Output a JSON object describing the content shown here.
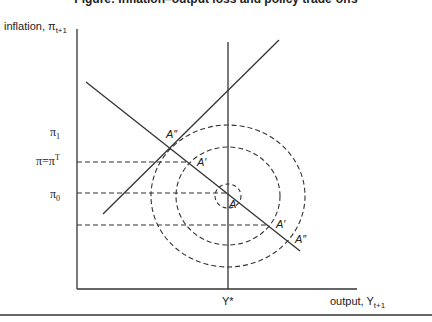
{
  "title": "Figure: Inflation–output loss and policy trade-offs",
  "axes": {
    "y_label": "inflation, π",
    "y_label_sub": "t+1",
    "x_label": "output, Y",
    "x_label_sub": "t+1"
  },
  "y_ticks": [
    {
      "label": "π",
      "sub": "1",
      "sup": ""
    },
    {
      "label": "π=π",
      "sub": "",
      "sup": "T"
    },
    {
      "label": "π",
      "sub": "0",
      "sup": ""
    }
  ],
  "x_ticks": [
    {
      "label": "Y*"
    }
  ],
  "points": {
    "a_double_prime_upper": "A″",
    "a_prime_upper": "A′",
    "a_center": "A",
    "a_prime_lower": "A′",
    "a_double_prime_lower": "A″"
  },
  "colors": {
    "line": "#333333",
    "text": "#222222"
  }
}
